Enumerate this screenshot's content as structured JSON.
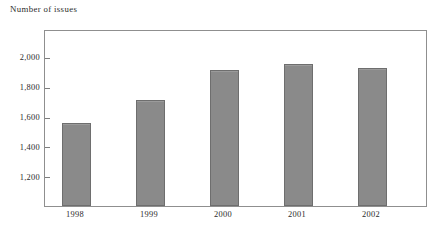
{
  "chart_data": {
    "type": "bar",
    "title": "Number of issues",
    "xlabel": "",
    "ylabel": "",
    "categories": [
      "1998",
      "1999",
      "2000",
      "2001",
      "2002"
    ],
    "values": [
      1560,
      1720,
      1920,
      1960,
      1930
    ],
    "series": [
      {
        "name": "Number of issues",
        "values": [
          1560,
          1720,
          1920,
          1960,
          1930
        ]
      }
    ],
    "ytick_labels": [
      "2,000",
      "1,800",
      "1,600",
      "1,400",
      "1,200"
    ],
    "ytick_values": [
      2000,
      1800,
      1600,
      1400,
      1200
    ],
    "ylim": [
      1007,
      2180
    ],
    "grid": false,
    "legend": "none",
    "bar_color": "#8a8a8a",
    "bar_edge_color": "#6e6e6e",
    "frame_color": "#8f8f8f",
    "background": "#ffffff"
  }
}
